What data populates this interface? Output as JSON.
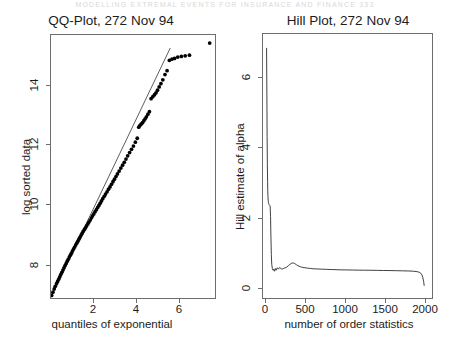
{
  "page": {
    "header_artifact": "MODELLING EXTREMAL EVENTS FOR INSURANCE AND FINANCE    333"
  },
  "panels": [
    {
      "id": "qq",
      "title": "QQ-Plot, 272 Nov 94",
      "xlabel": "quantiles of exponential",
      "ylabel": "log sorted data"
    },
    {
      "id": "hill",
      "title": "Hill Plot, 272 Nov 94",
      "xlabel": "number of order statistics",
      "ylabel": "Hill estimate of alpha"
    }
  ],
  "chart_data": [
    {
      "type": "scatter",
      "title": "QQ-Plot, 272 Nov 94",
      "xlabel": "quantiles of exponential",
      "ylabel": "log sorted data",
      "xlim": [
        0,
        7.7
      ],
      "ylim": [
        7.3,
        15.4
      ],
      "xticks": [
        2,
        4,
        6
      ],
      "yticks": [
        8,
        10,
        12,
        14
      ],
      "grid": false,
      "legend": "none",
      "reference_line": {
        "label": "fitted exponential reference line",
        "x": [
          0.02,
          5.6
        ],
        "y": [
          7.35,
          15.0
        ]
      },
      "points": {
        "x": [
          0.03,
          0.09,
          0.15,
          0.2,
          0.26,
          0.31,
          0.36,
          0.41,
          0.46,
          0.51,
          0.56,
          0.61,
          0.66,
          0.71,
          0.76,
          0.81,
          0.86,
          0.91,
          0.96,
          1.01,
          1.06,
          1.11,
          1.16,
          1.21,
          1.26,
          1.31,
          1.36,
          1.41,
          1.46,
          1.51,
          1.57,
          1.62,
          1.67,
          1.73,
          1.78,
          1.84,
          1.9,
          1.95,
          2.01,
          2.07,
          2.13,
          2.19,
          2.25,
          2.31,
          2.37,
          2.43,
          2.5,
          2.56,
          2.63,
          2.7,
          2.77,
          2.84,
          2.91,
          2.98,
          3.05,
          3.12,
          3.2,
          3.28,
          3.36,
          3.44,
          3.52,
          3.6,
          3.69,
          3.78,
          3.87,
          3.96,
          4.05,
          4.12,
          4.18,
          4.24,
          4.3,
          4.36,
          4.42,
          4.48,
          4.55,
          4.62,
          4.7,
          4.78,
          4.86,
          4.93,
          5.0,
          5.08,
          5.16,
          5.25,
          5.35,
          5.45,
          5.56,
          5.68,
          5.8,
          5.95,
          6.12,
          6.3,
          6.5,
          7.45
        ],
        "y": [
          7.38,
          7.48,
          7.58,
          7.66,
          7.74,
          7.81,
          7.88,
          7.95,
          8.02,
          8.09,
          8.16,
          8.23,
          8.3,
          8.36,
          8.43,
          8.49,
          8.56,
          8.62,
          8.68,
          8.75,
          8.81,
          8.87,
          8.93,
          8.99,
          9.05,
          9.11,
          9.17,
          9.23,
          9.29,
          9.35,
          9.41,
          9.46,
          9.52,
          9.58,
          9.64,
          9.7,
          9.77,
          9.83,
          9.89,
          9.96,
          10.02,
          10.09,
          10.15,
          10.22,
          10.29,
          10.36,
          10.43,
          10.5,
          10.57,
          10.65,
          10.72,
          10.8,
          10.88,
          10.96,
          11.04,
          11.12,
          11.21,
          11.3,
          11.39,
          11.48,
          11.58,
          11.68,
          11.78,
          11.88,
          11.98,
          12.1,
          12.22,
          12.56,
          12.62,
          12.66,
          12.7,
          12.76,
          12.82,
          12.88,
          12.96,
          13.04,
          13.44,
          13.5,
          13.56,
          13.62,
          13.7,
          13.8,
          13.9,
          14.02,
          14.18,
          14.3,
          14.62,
          14.66,
          14.68,
          14.72,
          14.74,
          14.76,
          14.78,
          15.15
        ]
      },
      "annotations": [
        "upper tail points flatten below the reference line",
        "single isolated outlier at far upper right"
      ]
    },
    {
      "type": "line",
      "title": "Hill Plot, 272 Nov 94",
      "xlabel": "number of order statistics",
      "ylabel": "Hill estimate of alpha",
      "xlim": [
        -40,
        2090
      ],
      "ylim": [
        -0.25,
        7.35
      ],
      "xticks": [
        0,
        500,
        1000,
        1500,
        2000
      ],
      "yticks": [
        0,
        2,
        4,
        6
      ],
      "grid": false,
      "legend": "none",
      "x": [
        5,
        9,
        12,
        15,
        18,
        20,
        22,
        24,
        26,
        28,
        30,
        33,
        36,
        40,
        45,
        50,
        55,
        60,
        65,
        70,
        78,
        86,
        95,
        105,
        115,
        125,
        140,
        155,
        170,
        185,
        200,
        220,
        240,
        260,
        280,
        300,
        320,
        340,
        360,
        380,
        400,
        430,
        460,
        490,
        520,
        560,
        600,
        650,
        700,
        760,
        820,
        880,
        950,
        1020,
        1090,
        1160,
        1240,
        1320,
        1400,
        1480,
        1560,
        1640,
        1720,
        1800,
        1860,
        1900,
        1930,
        1950,
        1965,
        1975,
        1985,
        1992
      ],
      "y": [
        6.95,
        5.6,
        4.4,
        3.6,
        3.1,
        2.85,
        2.7,
        2.6,
        2.55,
        2.5,
        2.48,
        2.45,
        2.44,
        2.43,
        2.42,
        2.4,
        2.1,
        1.5,
        1.0,
        0.72,
        0.6,
        0.55,
        0.58,
        0.52,
        0.6,
        0.55,
        0.62,
        0.58,
        0.63,
        0.6,
        0.58,
        0.6,
        0.62,
        0.64,
        0.68,
        0.72,
        0.75,
        0.76,
        0.74,
        0.71,
        0.68,
        0.65,
        0.63,
        0.62,
        0.61,
        0.6,
        0.59,
        0.585,
        0.58,
        0.575,
        0.57,
        0.565,
        0.56,
        0.558,
        0.555,
        0.552,
        0.55,
        0.548,
        0.545,
        0.542,
        0.54,
        0.536,
        0.532,
        0.528,
        0.52,
        0.51,
        0.49,
        0.46,
        0.41,
        0.33,
        0.22,
        0.1
      ],
      "annotations": [
        "sharp spike near the smallest order statistics reaching about 7",
        "stabilises around 0.55 to 0.75 over the bulk of the range",
        "sharp drop towards zero at the largest order statistics"
      ]
    }
  ]
}
